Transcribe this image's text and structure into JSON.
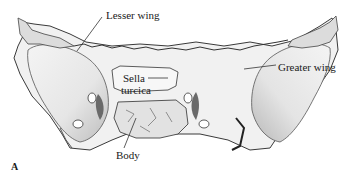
{
  "figure": {
    "panel": "A",
    "labels": {
      "lesser_wing": "Lesser wing",
      "greater_wing": "Greater wing",
      "sella_line1": "Sella",
      "sella_line2": "turcica",
      "body": "Body"
    }
  }
}
